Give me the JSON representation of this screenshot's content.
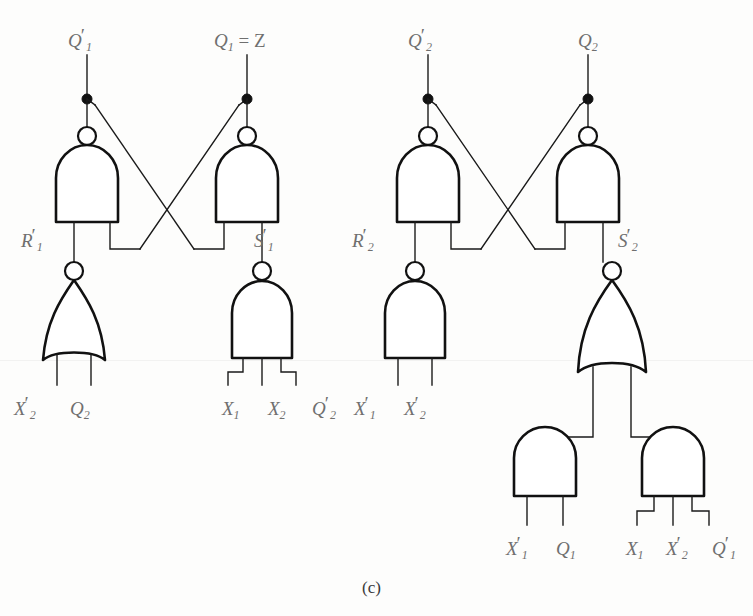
{
  "figure": {
    "caption": "(c)",
    "ink_color": "#111111",
    "label_color": "#6f6f6f",
    "background_color": "#fdfdfc"
  },
  "outputs": [
    {
      "id": "q1n",
      "text": "Q",
      "sub": "1",
      "prime": true,
      "equals": "",
      "x": 68,
      "y": 30
    },
    {
      "id": "q1z",
      "text": "Q",
      "sub": "1",
      "prime": false,
      "equals": " = Z",
      "x": 214,
      "y": 30
    },
    {
      "id": "q2n",
      "text": "Q",
      "sub": "2",
      "prime": true,
      "equals": "",
      "x": 408,
      "y": 30
    },
    {
      "id": "q2",
      "text": "Q",
      "sub": "2",
      "prime": false,
      "equals": "",
      "x": 578,
      "y": 30
    }
  ],
  "intermediate_labels": [
    {
      "id": "r1n",
      "text": "R",
      "sub": "1",
      "prime": true,
      "x": 21,
      "y": 230
    },
    {
      "id": "s1n",
      "text": "S",
      "sub": "1",
      "prime": true,
      "x": 254,
      "y": 230
    },
    {
      "id": "r2n",
      "text": "R",
      "sub": "2",
      "prime": true,
      "x": 352,
      "y": 230
    },
    {
      "id": "s2n",
      "text": "S",
      "sub": "2",
      "prime": true,
      "x": 618,
      "y": 230
    }
  ],
  "input_labels": [
    {
      "id": "in-x2n-nor1",
      "text": "X",
      "sub": "2",
      "prime": true,
      "x": 14,
      "y": 398
    },
    {
      "id": "in-q2-nor1",
      "text": "Q",
      "sub": "2",
      "prime": false,
      "x": 70,
      "y": 398
    },
    {
      "id": "in-x1-s1",
      "text": "X",
      "sub": "1",
      "prime": false,
      "x": 222,
      "y": 398
    },
    {
      "id": "in-x2-s1",
      "text": "X",
      "sub": "2",
      "prime": false,
      "x": 268,
      "y": 398
    },
    {
      "id": "in-q2n-s1",
      "text": "Q",
      "sub": "2",
      "prime": true,
      "x": 312,
      "y": 398
    },
    {
      "id": "in-x1n-r2",
      "text": "X",
      "sub": "1",
      "prime": true,
      "x": 354,
      "y": 398
    },
    {
      "id": "in-x2n-r2",
      "text": "X",
      "sub": "2",
      "prime": true,
      "x": 404,
      "y": 398
    },
    {
      "id": "in-x1n-and1",
      "text": "X",
      "sub": "1",
      "prime": true,
      "x": 506,
      "y": 538
    },
    {
      "id": "in-q1-and1",
      "text": "Q",
      "sub": "1",
      "prime": false,
      "x": 556,
      "y": 538
    },
    {
      "id": "in-x1-and2",
      "text": "X",
      "sub": "1",
      "prime": false,
      "x": 626,
      "y": 538
    },
    {
      "id": "in-x2n-and2",
      "text": "X",
      "sub": "2",
      "prime": true,
      "x": 666,
      "y": 538
    },
    {
      "id": "in-q1n-and2",
      "text": "Q",
      "sub": "1",
      "prime": true,
      "x": 712,
      "y": 538
    }
  ],
  "gates": [
    {
      "id": "nand-q1n",
      "type": "nand",
      "inputs": 2,
      "output_label": "Q1'"
    },
    {
      "id": "nand-q1",
      "type": "nand",
      "inputs": 2,
      "output_label": "Q1 = Z"
    },
    {
      "id": "nand-q2n",
      "type": "nand",
      "inputs": 2,
      "output_label": "Q2'"
    },
    {
      "id": "nand-q2",
      "type": "nand",
      "inputs": 2,
      "output_label": "Q2"
    },
    {
      "id": "nor-r1n",
      "type": "nor",
      "inputs": 2,
      "output_label": "R1'"
    },
    {
      "id": "nand-s1n",
      "type": "nand",
      "inputs": 3,
      "output_label": "S1'"
    },
    {
      "id": "nand-r2n",
      "type": "nand",
      "inputs": 2,
      "output_label": "R2'"
    },
    {
      "id": "nor-s2n",
      "type": "nor",
      "inputs": 2,
      "output_label": "S2'"
    },
    {
      "id": "and-left",
      "type": "and",
      "inputs": 2,
      "output_label": ""
    },
    {
      "id": "and-right",
      "type": "and",
      "inputs": 3,
      "output_label": ""
    }
  ]
}
